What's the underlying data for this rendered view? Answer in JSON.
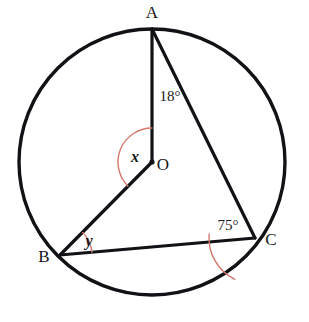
{
  "figure": {
    "type": "circle-geometry-diagram",
    "background_color": "#ffffff",
    "stroke_color": "#111216",
    "arc_color": "#d4786b",
    "circle": {
      "center_label": "O",
      "center_x": 152,
      "center_y": 162,
      "radius": 133,
      "stroke_width": 3.4
    },
    "points": [
      {
        "name": "A",
        "label": "A",
        "x": 152,
        "y": 29,
        "label_x": 152,
        "label_y": 18
      },
      {
        "name": "B",
        "label": "B",
        "x": 60,
        "y": 255,
        "label_x": 44,
        "label_y": 262
      },
      {
        "name": "C",
        "label": "C",
        "x": 255,
        "y": 238,
        "label_x": 271,
        "label_y": 245
      },
      {
        "name": "O",
        "label": "O",
        "x": 152,
        "y": 162,
        "label_x": 163,
        "label_y": 170
      }
    ],
    "segments": [
      {
        "name": "segment-A-O",
        "from": "A",
        "to": "O",
        "stroke_width": 3.2
      },
      {
        "name": "segment-O-B",
        "from": "O",
        "to": "B",
        "stroke_width": 3.2
      },
      {
        "name": "segment-A-C",
        "from": "A",
        "to": "C",
        "stroke_width": 3.2
      },
      {
        "name": "segment-B-C",
        "from": "B",
        "to": "C",
        "stroke_width": 3.2
      }
    ],
    "angles": [
      {
        "name": "angle-at-A",
        "label": "18°",
        "vertex": "A",
        "value": 18,
        "unit": "degrees",
        "label_x": 170,
        "label_y": 101,
        "arc_radius": 52,
        "arc_start_deg": 90,
        "arc_end_deg": 64
      },
      {
        "name": "angle-at-O",
        "label": "x",
        "vertex": "O",
        "value": null,
        "unit": "unknown",
        "label_x": 135,
        "label_y": 162,
        "arc_radius": 34,
        "arc_start_deg": 90,
        "arc_end_deg": 225
      },
      {
        "name": "angle-at-B",
        "label": "y",
        "vertex": "B",
        "value": null,
        "unit": "unknown",
        "label_x": 89,
        "label_y": 246,
        "arc_radius": 32,
        "arc_start_deg": 5,
        "arc_end_deg": 45
      },
      {
        "name": "angle-at-C",
        "label": "75°",
        "vertex": "C",
        "value": 75,
        "unit": "degrees",
        "label_x": 228,
        "label_y": 230,
        "arc_radius": 46,
        "arc_start_deg": 175,
        "arc_end_deg": 244
      }
    ]
  }
}
